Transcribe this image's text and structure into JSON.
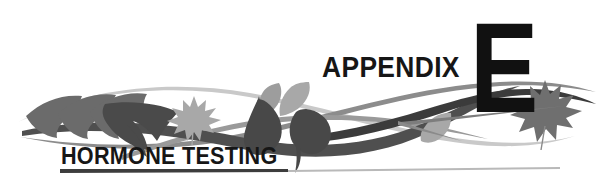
{
  "page": {
    "background_color": "#ffffff",
    "width": 615,
    "height": 180
  },
  "header": {
    "appendix_label": "APPENDIX",
    "appendix_letter": "E",
    "title": "HORMONE TESTING"
  },
  "rule": {
    "dark_color": "#3d3d3d",
    "light_color": "#b9b9b9"
  },
  "decoration": {
    "name": "leaf-and-swoosh-ornament",
    "colors": {
      "dark_leaf": "#4a4a4a",
      "mid_leaf": "#6b6b6b",
      "light_leaf": "#a8a8a8",
      "dark_swoosh": "#3b3b3b",
      "mid_swoosh": "#8c8c8c",
      "light_swoosh": "#c9c9c9"
    },
    "elements": [
      {
        "name": "feather-leaf-pair-left",
        "tone": "mid"
      },
      {
        "name": "curved-dark-leaf",
        "tone": "dark"
      },
      {
        "name": "maple-leaf-left",
        "tone": "light"
      },
      {
        "name": "teardrop-leaf-center-left",
        "tone": "dark"
      },
      {
        "name": "pointed-leaf-center",
        "tone": "light"
      },
      {
        "name": "teardrop-leaf-center-right",
        "tone": "dark"
      },
      {
        "name": "small-leaf-right",
        "tone": "light"
      },
      {
        "name": "maple-leaf-right",
        "tone": "mid"
      },
      {
        "name": "swoosh-thick-dark",
        "tone": "dark"
      },
      {
        "name": "swoosh-thin-mid",
        "tone": "mid"
      },
      {
        "name": "swoosh-thin-light",
        "tone": "light"
      }
    ]
  }
}
